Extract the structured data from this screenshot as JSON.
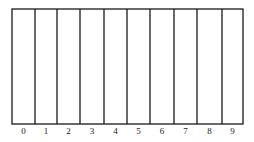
{
  "diagram": {
    "type": "partitioned-rectangle",
    "columns": [
      {
        "label": "0"
      },
      {
        "label": "1"
      },
      {
        "label": "2"
      },
      {
        "label": "3"
      },
      {
        "label": "4"
      },
      {
        "label": "5"
      },
      {
        "label": "6"
      },
      {
        "label": "7"
      },
      {
        "label": "8"
      },
      {
        "label": "9"
      }
    ],
    "line_color": "#1a1a1a"
  }
}
